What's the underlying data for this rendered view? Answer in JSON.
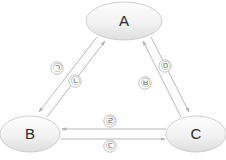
{
  "diagram": {
    "type": "directed-graph-triangle",
    "background_color": "#ffffff",
    "node_stroke_color": "#cfcfcf",
    "node_fill_top_color": "#fcfcfc",
    "node_fill_bottom_color": "#e2e2e2",
    "edge_color": "#b9b9b9",
    "label_text_color": "#2b2b2b",
    "edge_label_text_color": "#555555",
    "nodes": [
      {
        "id": "A",
        "label": "A",
        "cx": 124,
        "cy": 21,
        "rx": 38,
        "ry": 19
      },
      {
        "id": "B",
        "label": "B",
        "cx": 30,
        "cy": 134,
        "rx": 30,
        "ry": 18
      },
      {
        "id": "C",
        "label": "C",
        "cx": 196,
        "cy": 134,
        "rx": 30,
        "ry": 18
      }
    ],
    "edges": [
      {
        "id": "edge-a-to-b",
        "label": "㉠",
        "from": "A",
        "to": "B",
        "label_x": 57,
        "label_y": 68,
        "x1": 97,
        "y1": 37,
        "x2": 39,
        "y2": 112
      },
      {
        "id": "edge-b-to-a",
        "label": "㉡",
        "from": "B",
        "to": "A",
        "label_x": 75,
        "label_y": 81,
        "x1": 47,
        "y1": 117,
        "x2": 105,
        "y2": 41
      },
      {
        "id": "edge-a-to-c",
        "label": "㉤",
        "from": "A",
        "to": "C",
        "label_x": 165,
        "label_y": 66,
        "x1": 151,
        "y1": 37,
        "x2": 189,
        "y2": 112
      },
      {
        "id": "edge-c-to-a",
        "label": "㉥",
        "from": "C",
        "to": "A",
        "label_x": 145,
        "label_y": 83,
        "x1": 181,
        "y1": 117,
        "x2": 143,
        "y2": 41
      },
      {
        "id": "edge-c-to-b",
        "label": "㉣",
        "from": "C",
        "to": "B",
        "label_x": 110,
        "label_y": 121,
        "x1": 166,
        "y1": 129,
        "x2": 62,
        "y2": 129
      },
      {
        "id": "edge-b-to-c",
        "label": "㉢",
        "from": "B",
        "to": "C",
        "label_x": 110,
        "label_y": 146,
        "x1": 61,
        "y1": 139,
        "x2": 165,
        "y2": 139
      }
    ]
  }
}
